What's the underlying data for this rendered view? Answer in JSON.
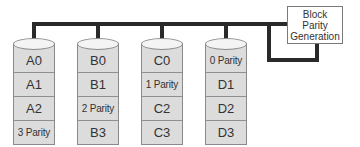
{
  "diagram": {
    "type": "RAID block-interleaved distributed parity",
    "parity_generator": {
      "lines": [
        "Block",
        "Parity",
        "Generation"
      ]
    },
    "disks": [
      {
        "name": "Disk A",
        "blocks": [
          "A0",
          "A1",
          "A2",
          "3 Parity"
        ]
      },
      {
        "name": "Disk B",
        "blocks": [
          "B0",
          "B1",
          "2 Parity",
          "B3"
        ]
      },
      {
        "name": "Disk C",
        "blocks": [
          "C0",
          "1 Parity",
          "C2",
          "C3"
        ]
      },
      {
        "name": "Disk D",
        "blocks": [
          "0 Parity",
          "D1",
          "D2",
          "D3"
        ]
      }
    ],
    "colors": {
      "disk_fill": "#dcdcdc",
      "disk_top": "#f4f4f4",
      "bus": "#2a2a2a",
      "outline": "#8a8a8a"
    }
  }
}
